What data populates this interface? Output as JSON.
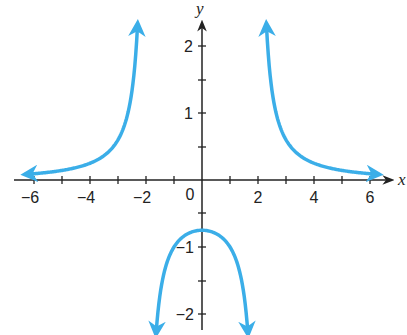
{
  "chart_data": {
    "type": "line",
    "title": "",
    "function": "y = 3/(x^2 - 4)",
    "xlabel": "x",
    "ylabel": "y",
    "xlim": [
      -6.5,
      6.8
    ],
    "ylim": [
      -2.3,
      2.5
    ],
    "grid": false,
    "legend": null,
    "x_ticks": [
      -6,
      -5,
      -4,
      -3,
      -2,
      -1,
      1,
      2,
      3,
      4,
      5,
      6
    ],
    "x_tick_labels": [
      "-6",
      "-4",
      "-2",
      "0",
      "2",
      "4",
      "6"
    ],
    "y_ticks": [
      -2,
      -1.5,
      -1,
      -0.5,
      0.5,
      1,
      1.5,
      2
    ],
    "y_tick_labels": [
      "2",
      "1",
      "-1",
      "-2"
    ],
    "origin_label": "0",
    "curve_color": "#3BAEE8",
    "axis_color": "#222222",
    "vertical_asymptotes": [
      -2,
      2
    ],
    "horizontal_asymptote": 0,
    "series": [
      {
        "name": "left branch",
        "x": [
          -6.3,
          -6,
          -5,
          -4,
          -3,
          -2.6,
          -2.4,
          -2.3
        ],
        "y": [
          0.08,
          0.09,
          0.14,
          0.25,
          0.6,
          1.09,
          1.7,
          2.33
        ],
        "arrows": "both ends"
      },
      {
        "name": "middle branch",
        "x": [
          -1.65,
          -1.5,
          -1,
          -0.5,
          0,
          0.5,
          1,
          1.5,
          1.65
        ],
        "y": [
          -2.36,
          -1.71,
          -1.0,
          -0.8,
          -0.75,
          -0.8,
          -1.0,
          -1.71,
          -2.36
        ],
        "arrows": "both ends"
      },
      {
        "name": "right branch",
        "x": [
          2.3,
          2.4,
          2.6,
          3,
          4,
          5,
          6,
          6.3
        ],
        "y": [
          2.33,
          1.7,
          1.09,
          0.6,
          0.25,
          0.14,
          0.09,
          0.08
        ],
        "arrows": "both ends"
      }
    ]
  },
  "labels": {
    "x_axis": "x",
    "y_axis": "y",
    "origin": "0",
    "x_neg6": "−6",
    "x_neg4": "−4",
    "x_neg2": "−2",
    "x_2": "2",
    "x_4": "4",
    "x_6": "6",
    "y_2": "2",
    "y_1": "1",
    "y_neg1": "−1",
    "y_neg2": "−2"
  }
}
